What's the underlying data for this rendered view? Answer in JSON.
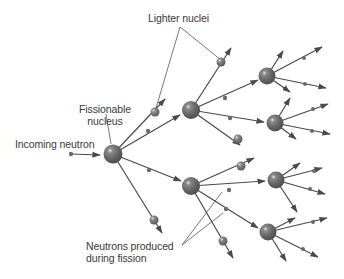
{
  "labels": {
    "lighter_nuclei": "Lighter nuclei",
    "fissionable_line1": "Fissionable",
    "fissionable_line2": "nucleus",
    "incoming_neutron": "Incoming neutron",
    "neutrons_line1": "Neutrons produced",
    "neutrons_line2": "during fission"
  },
  "colors": {
    "nucleus": "#6b6b6b",
    "nucleus_highlight": "#f2f2f2",
    "line": "#4a4a4a",
    "text": "#3a3a3a",
    "leader": "#555555"
  },
  "generations": [
    {
      "level": 0,
      "nuclei_count": 1
    },
    {
      "level": 1,
      "nuclei_count": 2
    },
    {
      "level": 2,
      "nuclei_count": 4
    }
  ]
}
